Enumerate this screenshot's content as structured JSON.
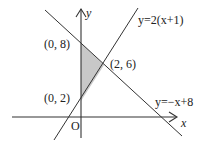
{
  "diagram": {
    "axes": {
      "x_label": "x",
      "y_label": "y",
      "origin_label": "O"
    },
    "lines": [
      {
        "equation": "y=2(x+1)"
      },
      {
        "equation": "y=−x+8"
      }
    ],
    "points": [
      {
        "label": "(0,  8)"
      },
      {
        "label": "(2,  6)"
      },
      {
        "label": "(0,  2)"
      }
    ],
    "shaded_region": {
      "vertices": [
        "(0, 8)",
        "(2, 6)",
        "(0, 2)"
      ],
      "fill": "#c8c8c8"
    }
  }
}
